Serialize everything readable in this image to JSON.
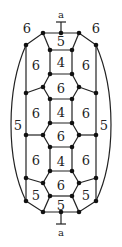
{
  "diagram": {
    "type": "polyhedral graph (fullerene-like face labeling)",
    "cut_label_top": "a",
    "cut_label_bottom": "a",
    "face_labels": [
      {
        "id": "top-left",
        "text": "6",
        "x": 27,
        "y": 28
      },
      {
        "id": "top-right",
        "text": "6",
        "x": 96,
        "y": 28
      },
      {
        "id": "top-pentagon",
        "text": "5",
        "x": 61,
        "y": 41
      },
      {
        "id": "sq1",
        "text": "4",
        "x": 61,
        "y": 62
      },
      {
        "id": "l1",
        "text": "6",
        "x": 36,
        "y": 65
      },
      {
        "id": "r1",
        "text": "6",
        "x": 86,
        "y": 65
      },
      {
        "id": "hex1",
        "text": "6",
        "x": 61,
        "y": 88
      },
      {
        "id": "l2",
        "text": "6",
        "x": 36,
        "y": 113
      },
      {
        "id": "sq2",
        "text": "4",
        "x": 61,
        "y": 112
      },
      {
        "id": "r2",
        "text": "6",
        "x": 86,
        "y": 113
      },
      {
        "id": "outer-left",
        "text": "5",
        "x": 18,
        "y": 125
      },
      {
        "id": "outer-right",
        "text": "5",
        "x": 104,
        "y": 125
      },
      {
        "id": "hex2",
        "text": "6",
        "x": 61,
        "y": 136
      },
      {
        "id": "l3",
        "text": "6",
        "x": 36,
        "y": 160
      },
      {
        "id": "sq3",
        "text": "4",
        "x": 61,
        "y": 161
      },
      {
        "id": "r3",
        "text": "6",
        "x": 86,
        "y": 160
      },
      {
        "id": "hex3",
        "text": "6",
        "x": 61,
        "y": 185
      },
      {
        "id": "l-pent",
        "text": "5",
        "x": 36,
        "y": 195
      },
      {
        "id": "r-pent",
        "text": "5",
        "x": 86,
        "y": 195
      },
      {
        "id": "bottom-pentagon",
        "text": "5",
        "x": 61,
        "y": 205
      }
    ]
  }
}
